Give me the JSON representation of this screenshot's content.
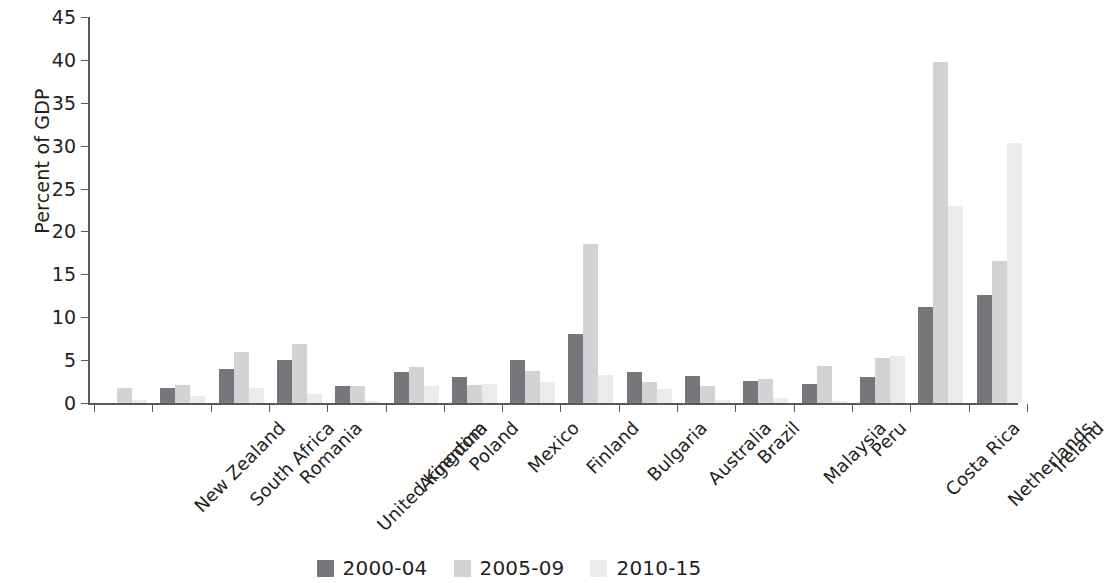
{
  "chart_data": {
    "type": "bar",
    "title": "",
    "subtitle": "",
    "xlabel": "",
    "ylabel": "Percent of GDP",
    "ylim": [
      0,
      45
    ],
    "ytick_step": 5,
    "yticks": [
      0,
      5,
      10,
      15,
      20,
      25,
      30,
      35,
      40,
      45
    ],
    "grid": false,
    "legend_position": "bottom-center",
    "categories": [
      "New Zealand",
      "South Africa",
      "Romania",
      "United Kingdom",
      "Argentina",
      "Poland",
      "Mexico",
      "Finland",
      "Bulgaria",
      "Australia",
      "Brazil",
      "Malaysia",
      "Peru",
      "Costa Rica",
      "Netherlands",
      "Ireland"
    ],
    "series": [
      {
        "name": "2000-04",
        "color": "#76777a",
        "values": [
          0,
          1.8,
          4.0,
          5.0,
          2.0,
          3.6,
          3.0,
          5.0,
          8.0,
          3.6,
          3.2,
          2.6,
          2.2,
          3.0,
          11.2,
          12.6
        ]
      },
      {
        "name": "2005-09",
        "color": "#d2d3d4",
        "values": [
          1.8,
          2.1,
          6.0,
          6.9,
          2.0,
          4.2,
          2.1,
          3.7,
          18.5,
          2.4,
          2.0,
          2.8,
          4.3,
          5.2,
          39.8,
          16.5
        ]
      },
      {
        "name": "2010-15",
        "color": "#ebebeb",
        "values": [
          0.4,
          0.8,
          1.7,
          1.0,
          0.2,
          2.0,
          2.2,
          2.5,
          3.3,
          1.6,
          0.3,
          0.6,
          0.2,
          5.5,
          23.0,
          30.3
        ]
      }
    ]
  },
  "axis": {
    "y_tick_labels": [
      "45",
      "40",
      "35",
      "30",
      "25",
      "20",
      "15",
      "10",
      "5",
      "0"
    ],
    "y_axis_title": "Percent of GDP"
  },
  "legend": {
    "items": [
      {
        "label": "2000-04",
        "color": "#76777a"
      },
      {
        "label": "2005-09",
        "color": "#d2d3d4"
      },
      {
        "label": "2010-15",
        "color": "#ebebeb"
      }
    ]
  }
}
